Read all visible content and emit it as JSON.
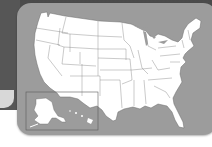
{
  "map": {
    "subject": "United States outline map",
    "regions": [
      "Contiguous United States",
      "Alaska",
      "Hawaii"
    ],
    "colors": {
      "backdrop": "#565656",
      "panel": "#9c9c9c",
      "land": "#ffffff",
      "border": "#6a6a6a",
      "page": "#ffffff"
    }
  }
}
